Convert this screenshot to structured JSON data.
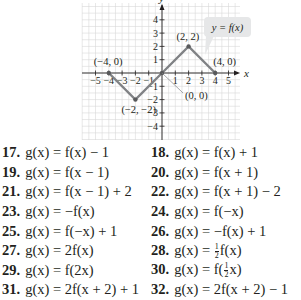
{
  "graph": {
    "x_axis_label": "x",
    "y_axis_label": "y",
    "x_ticks": [
      "-5",
      "-4",
      "-3",
      "-2",
      "-1",
      "1",
      "2",
      "3",
      "4",
      "5"
    ],
    "y_ticks": [
      "4",
      "3",
      "2",
      "1",
      "-1",
      "-2",
      "-3",
      "-4"
    ],
    "callout": "y = f(x)",
    "points": [
      {
        "label": "(−4, 0)",
        "x": -4,
        "y": 0
      },
      {
        "label": "(−2, −2)",
        "x": -2,
        "y": -2
      },
      {
        "label": "(0, 0)",
        "x": 0,
        "y": 0
      },
      {
        "label": "(2, 2)",
        "x": 2,
        "y": 2
      },
      {
        "label": "(4, 0)",
        "x": 4,
        "y": 0
      }
    ],
    "colors": {
      "curve": "#808285",
      "grid": "#d9d9d9",
      "axis": "#231f20",
      "callout_bg": "#e6e7e8"
    }
  },
  "chart_data": {
    "type": "line",
    "title": "y = f(x)",
    "xlabel": "x",
    "ylabel": "y",
    "x": [
      -4,
      -2,
      0,
      2,
      4
    ],
    "series": [
      {
        "name": "f(x)",
        "values": [
          0,
          -2,
          0,
          2,
          0
        ]
      }
    ],
    "xlim": [
      -5,
      5
    ],
    "ylim": [
      -4,
      4
    ],
    "grid": true,
    "annotations": [
      "(−4, 0)",
      "(−2, −2)",
      "(0, 0)",
      "(2, 2)",
      "(4, 0)",
      "y = f(x)"
    ]
  },
  "exercises": [
    {
      "num": "17.",
      "eq": "g(x) = f(x) − 1"
    },
    {
      "num": "18.",
      "eq": "g(x) = f(x) + 1"
    },
    {
      "num": "19.",
      "eq": "g(x) = f(x − 1)"
    },
    {
      "num": "20.",
      "eq": "g(x) = f(x + 1)"
    },
    {
      "num": "21.",
      "eq": "g(x) = f(x − 1) + 2"
    },
    {
      "num": "22.",
      "eq": "g(x) = f(x + 1) − 2"
    },
    {
      "num": "23.",
      "eq": "g(x) = −f(x)"
    },
    {
      "num": "24.",
      "eq": "g(x) = f(−x)"
    },
    {
      "num": "25.",
      "eq": "g(x) = f(−x) + 1"
    },
    {
      "num": "26.",
      "eq": "g(x) = −f(x) + 1"
    },
    {
      "num": "27.",
      "eq": "g(x) = 2f(x)"
    },
    {
      "num": "28.",
      "eq_pre": "g(x) = ",
      "frac_num": "1",
      "frac_den": "2",
      "eq_post": "f(x)"
    },
    {
      "num": "29.",
      "eq": "g(x) = f(2x)"
    },
    {
      "num": "30.",
      "eq_pre": "g(x) = f(",
      "frac_num": "1",
      "frac_den": "2",
      "eq_post": "x)"
    },
    {
      "num": "31.",
      "eq": "g(x) = 2f(x + 2) + 1"
    },
    {
      "num": "32.",
      "eq": "g(x) = 2f(x + 2) − 1"
    }
  ]
}
